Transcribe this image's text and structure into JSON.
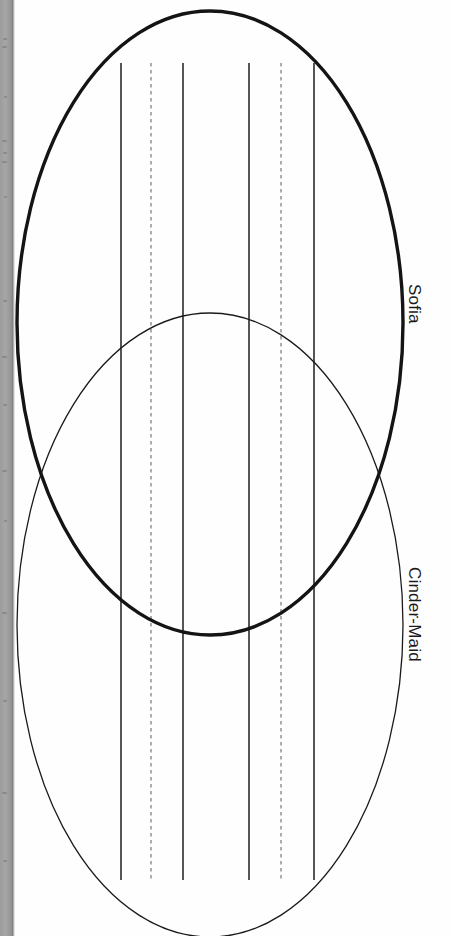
{
  "page": {
    "kind": "scanned-worksheet-page",
    "orientation": "rotated-90-clockwise",
    "background_color": "#ffffff",
    "gutter_color": "#9e9e9e"
  },
  "diagram": {
    "type": "venn-diagram",
    "set_count": 2,
    "labels": {
      "set_a": "Sofia",
      "set_b": "Cinder-Maid"
    },
    "stroke_color": "#1a1a1a",
    "writing_line_color": "#2b2b2b",
    "dashed_line_color": "#8a8a8a",
    "ellipses": [
      {
        "name": "Sofia",
        "cx": 210,
        "cy": 323,
        "rx": 193,
        "ry": 312,
        "stroke_width": 3.2,
        "emphasis": "bold"
      },
      {
        "name": "Cinder-Maid",
        "cx": 210,
        "cy": 625,
        "rx": 193,
        "ry": 312,
        "stroke_width": 1.2,
        "emphasis": "thin"
      }
    ],
    "writing_lines": [
      {
        "x": 121,
        "style": "solid"
      },
      {
        "x": 151,
        "style": "dashed"
      },
      {
        "x": 183,
        "style": "solid"
      },
      {
        "x": 249,
        "style": "solid"
      },
      {
        "x": 281,
        "style": "dashed"
      },
      {
        "x": 314,
        "style": "solid"
      }
    ],
    "writing_line_top": 63,
    "writing_line_bottom": 880
  }
}
